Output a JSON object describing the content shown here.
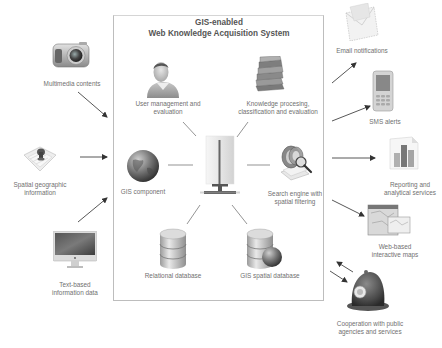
{
  "title": {
    "line1": "GIS-enabled",
    "line2": "Web Knowledge Acquisition System"
  },
  "inputs": [
    {
      "id": "multimedia",
      "label_lines": [
        "Multimedia contents"
      ],
      "icon": "camera-icon"
    },
    {
      "id": "spatial",
      "label_lines": [
        "Spatial geographic",
        "information"
      ],
      "icon": "map-pin-icon"
    },
    {
      "id": "text",
      "label_lines": [
        "Text-based",
        "information data"
      ],
      "icon": "monitor-icon"
    }
  ],
  "system_components": [
    {
      "id": "user-mgmt",
      "label_lines": [
        "User management and",
        "evaluation"
      ],
      "icon": "user-icon"
    },
    {
      "id": "knowledge",
      "label_lines": [
        "Knowledge procesing,",
        "classification and evaluation"
      ],
      "icon": "books-icon"
    },
    {
      "id": "gis",
      "label_lines": [
        "GIS component"
      ],
      "icon": "globe-icon"
    },
    {
      "id": "search",
      "label_lines": [
        "Search engine with",
        "spatial filtering"
      ],
      "icon": "search-engine-icon"
    },
    {
      "id": "relational-db",
      "label_lines": [
        "Relational database"
      ],
      "icon": "database-icon"
    },
    {
      "id": "gis-db",
      "label_lines": [
        "GIS spatial database"
      ],
      "icon": "spatial-database-icon"
    },
    {
      "id": "server",
      "label_lines": [],
      "icon": "server-icon"
    }
  ],
  "outputs": [
    {
      "id": "email",
      "label_lines": [
        "Email notifications"
      ],
      "icon": "envelope-icon"
    },
    {
      "id": "sms",
      "label_lines": [
        "SMS alerts"
      ],
      "icon": "mobile-phone-icon"
    },
    {
      "id": "reporting",
      "label_lines": [
        "Reporting and",
        "analytical services"
      ],
      "icon": "bar-chart-icon"
    },
    {
      "id": "maps",
      "label_lines": [
        "Web-based",
        "interactive maps"
      ],
      "icon": "map-icon"
    },
    {
      "id": "cooperation",
      "label_lines": [
        "Cooperation with public",
        "agencies and services"
      ],
      "icon": "police-helmet-icon"
    }
  ],
  "colors": {
    "box_border": "#bdbdbd",
    "line": "#555555",
    "text": "#707070"
  }
}
